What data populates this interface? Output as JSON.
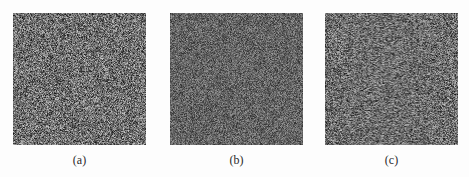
{
  "figure": {
    "background": "#fdfdfd",
    "panels": [
      {
        "id": "a",
        "label": "(a)",
        "description": "random noise image",
        "x": 13,
        "width": 133,
        "height": 132,
        "noise": {
          "mean": 112,
          "spread": 95,
          "seed": 11
        }
      },
      {
        "id": "b",
        "label": "(b)",
        "description": "random noise image (lower contrast)",
        "x": 170,
        "width": 133,
        "height": 132,
        "noise": {
          "mean": 100,
          "spread": 60,
          "seed": 23
        }
      },
      {
        "id": "c",
        "label": "(c)",
        "description": "random noise image",
        "x": 325,
        "width": 132,
        "height": 132,
        "noise": {
          "mean": 110,
          "spread": 92,
          "seed": 37
        }
      }
    ]
  }
}
